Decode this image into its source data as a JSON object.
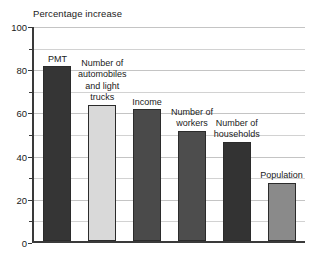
{
  "chart_data": {
    "type": "bar",
    "title": "Percentage increase",
    "xlabel": "",
    "ylabel": "",
    "ylim": [
      0,
      100
    ],
    "grid": true,
    "legend_position": "none",
    "y_major_ticks": [
      0,
      20,
      40,
      60,
      80,
      100
    ],
    "y_minor_ticks": [
      10,
      30,
      50,
      70,
      90
    ],
    "y_tick_labels": [
      "0",
      "20",
      "40",
      "60",
      "80",
      "100"
    ],
    "categories": [
      "PMT",
      "Number of automobiles and light trucks",
      "Income",
      "Number of workers",
      "Number of households",
      "Population"
    ],
    "values": [
      81,
      63,
      61,
      51,
      46,
      27
    ],
    "bar_labels": [
      "PMT",
      "Number of\nautomobiles\nand light\ntrucks",
      "Income",
      "Number of\nworkers",
      "Number of\nhouseholds",
      "Population"
    ],
    "bar_colors": [
      "#353535",
      "#d9d9d9",
      "#4a4a4a",
      "#4d4d4d",
      "#333333",
      "#8a8a8a"
    ],
    "bar_border_color": "#2b2b2b",
    "grid_color": "#d2d2d2",
    "axis_color": "#3a3a3a",
    "text_color": "#1a1a1a",
    "background": "#ffffff"
  }
}
